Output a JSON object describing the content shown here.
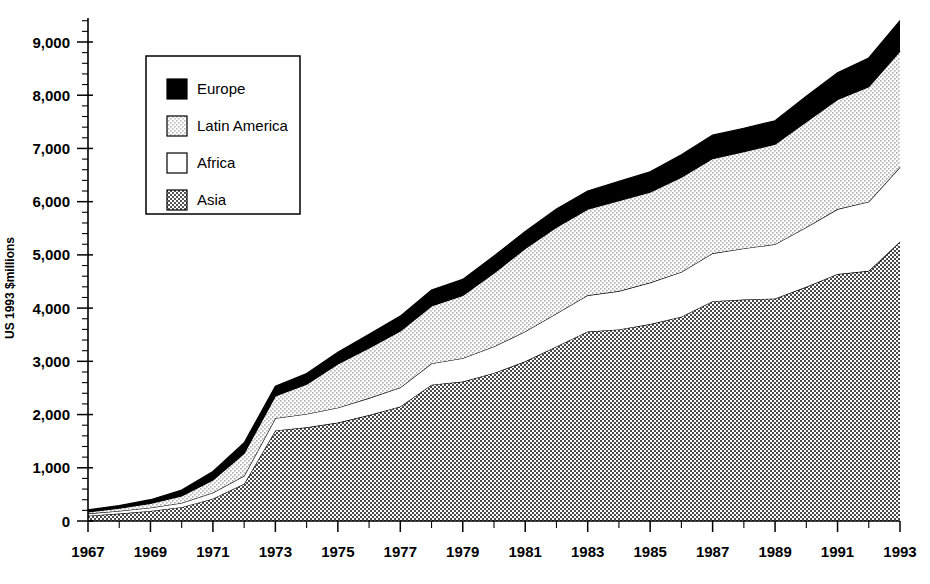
{
  "chart_data": {
    "type": "area",
    "stacked": true,
    "title": "",
    "subtitle": "",
    "xlabel": "",
    "ylabel": "US 1993 $millions",
    "xlim": [
      1967,
      1993
    ],
    "ylim": [
      0,
      9500
    ],
    "ytick_values": [
      0,
      1000,
      2000,
      3000,
      4000,
      5000,
      6000,
      7000,
      8000,
      9000
    ],
    "ytick_labels": [
      "0",
      "1,000",
      "2,000",
      "3,000",
      "4,000",
      "5,000",
      "6,000",
      "7,000",
      "8,000",
      "9,000"
    ],
    "y_minor_tick_step": 200,
    "xtick_values": [
      1967,
      1969,
      1971,
      1973,
      1975,
      1977,
      1979,
      1981,
      1983,
      1985,
      1987,
      1989,
      1991,
      1993
    ],
    "xtick_labels": [
      "1967",
      "1969",
      "1971",
      "1973",
      "1975",
      "1977",
      "1979",
      "1981",
      "1983",
      "1985",
      "1987",
      "1989",
      "1991",
      "1993"
    ],
    "x": [
      1967,
      1968,
      1969,
      1970,
      1971,
      1972,
      1973,
      1974,
      1975,
      1976,
      1977,
      1978,
      1979,
      1980,
      1981,
      1982,
      1983,
      1984,
      1985,
      1986,
      1987,
      1988,
      1989,
      1990,
      1991,
      1992,
      1993
    ],
    "grid": false,
    "legend_position": "upper-left-inset",
    "stack_order_bottom_to_top": [
      "Asia",
      "Africa",
      "Latin America",
      "Europe"
    ],
    "series": [
      {
        "name": "Asia",
        "fill": "checker-50",
        "color": "#808080",
        "values": [
          100,
          140,
          190,
          260,
          420,
          700,
          1700,
          1760,
          1850,
          1990,
          2150,
          2560,
          2620,
          2780,
          3000,
          3280,
          3560,
          3600,
          3700,
          3840,
          4130,
          4160,
          4180,
          4400,
          4640,
          4700,
          5250
        ]
      },
      {
        "name": "Africa",
        "fill": "solid-white",
        "color": "#ffffff",
        "values": [
          40,
          50,
          60,
          80,
          110,
          150,
          230,
          250,
          280,
          320,
          360,
          400,
          440,
          500,
          560,
          620,
          680,
          720,
          780,
          840,
          900,
          960,
          1020,
          1120,
          1220,
          1300,
          1400
        ]
      },
      {
        "name": "Latin America",
        "fill": "dot-25",
        "color": "#d8d8d8",
        "values": [
          30,
          50,
          80,
          130,
          240,
          420,
          420,
          560,
          820,
          940,
          1060,
          1080,
          1180,
          1380,
          1560,
          1620,
          1620,
          1700,
          1700,
          1780,
          1780,
          1820,
          1880,
          1980,
          2060,
          2160,
          2180
        ]
      },
      {
        "name": "Europe",
        "fill": "solid-black",
        "color": "#000000",
        "values": [
          40,
          50,
          70,
          110,
          160,
          200,
          180,
          200,
          220,
          260,
          280,
          300,
          300,
          320,
          320,
          340,
          340,
          360,
          380,
          420,
          440,
          440,
          440,
          480,
          500,
          540,
          570
        ]
      }
    ],
    "series_totals": [
      210,
      290,
      400,
      580,
      930,
      1470,
      2530,
      2770,
      3170,
      3510,
      3850,
      4340,
      4540,
      4980,
      5440,
      5860,
      6200,
      6380,
      6560,
      6880,
      7250,
      7380,
      7520,
      7980,
      8420,
      8700,
      9400
    ]
  },
  "legend": {
    "items": [
      {
        "label": "Europe",
        "swatch": "solid-black"
      },
      {
        "label": "Latin America",
        "swatch": "dot-25"
      },
      {
        "label": "Africa",
        "swatch": "solid-white"
      },
      {
        "label": "Asia",
        "swatch": "checker-50"
      }
    ]
  }
}
